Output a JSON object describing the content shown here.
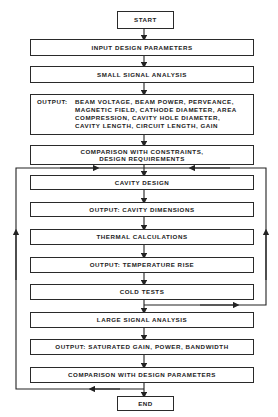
{
  "flowchart": {
    "start": "START",
    "input": "INPUT DESIGN PARAMETERS",
    "small_signal": "SMALL SIGNAL ANALYSIS",
    "output1": {
      "label": "OUTPUT:",
      "lines": [
        "BEAM VOLTAGE, BEAM POWER, PERVEANCE,",
        "MAGNETIC FIELD, CATHODE DIAMETER, AREA",
        "COMPRESSION, CAVITY HOLE DIAMETER,",
        "CAVITY LENGTH, CIRCUIT LENGTH, GAIN"
      ]
    },
    "comparison1": {
      "line1": "COMPARISON WITH CONSTRAINTS,",
      "line2": "DESIGN REQUIREMENTS"
    },
    "cavity_design": "CAVITY DESIGN",
    "output_cavity": "OUTPUT: CAVITY DIMENSIONS",
    "thermal": "THERMAL CALCULATIONS",
    "output_temp": "OUTPUT: TEMPERATURE RISE",
    "cold_tests": "COLD TESTS",
    "large_signal": "LARGE SIGNAL ANALYSIS",
    "output_saturated": "OUTPUT: SATURATED GAIN, POWER, BANDWIDTH",
    "comparison2": "COMPARISON WITH DESIGN PARAMETERS",
    "end": "END"
  }
}
